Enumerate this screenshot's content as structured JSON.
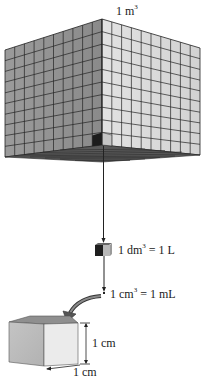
{
  "diagram": {
    "type": "volume-units-illustration",
    "big_cube": {
      "label_base": "1 m",
      "label_exp": "3",
      "grid_divisions": 10,
      "colors": {
        "left_face": "#9a9a9a",
        "right_face": "#d9d9d9",
        "grid": "#222222",
        "bottom": "#555555",
        "highlight_dark": "#1c1c1c",
        "highlight_light": "#c8c8c8"
      }
    },
    "dm_cube": {
      "label_prefix": "1 dm",
      "label_exp": "3",
      "label_suffix": " = 1 L"
    },
    "cm_cube": {
      "label_prefix": "1 cm",
      "label_exp": "3",
      "label_suffix": " = 1 mL",
      "height_label": "1 cm",
      "width_label": "1 cm",
      "colors": {
        "front": "#bdbdbd",
        "right": "#e8e8e8",
        "top": "#8f8f8f"
      }
    }
  }
}
